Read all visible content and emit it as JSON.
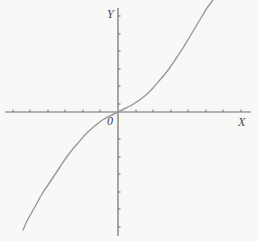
{
  "figure": {
    "background_color": "#f8f8f6",
    "width": 259,
    "height": 241
  },
  "labels": {
    "y_axis": "Y",
    "x_axis": "X",
    "origin": "0"
  },
  "axes": {
    "color": "#6f6f72",
    "x_axis": {
      "y_pixel": 112,
      "x_start_pixel": 5,
      "x_end_pixel": 251,
      "tick_spacing_pixel": 17.6,
      "tick_length_pixel": 3
    },
    "y_axis": {
      "x_pixel": 118,
      "y_start_pixel": 8,
      "y_end_pixel": 236,
      "tick_spacing_pixel": 17.6,
      "tick_length_pixel": 3
    }
  },
  "chart_data": {
    "type": "line",
    "title": "",
    "xlabel": "X",
    "ylabel": "Y",
    "grid": false,
    "legend": "none",
    "curve_color": "#9a9a9c",
    "curve_width": 1.4,
    "function": "y = x^3",
    "xlim": [
      -2.2,
      2.1
    ],
    "ylim": [
      -2.2,
      2.1
    ],
    "x": [
      -2.15,
      -2.0,
      -1.85,
      -1.7,
      -1.55,
      -1.4,
      -1.25,
      -1.1,
      -0.95,
      -0.8,
      -0.65,
      -0.5,
      -0.35,
      -0.2,
      0.0,
      0.2,
      0.35,
      0.5,
      0.65,
      0.8,
      0.95,
      1.1,
      1.25,
      1.4,
      1.55,
      1.7,
      1.85,
      2.0,
      2.1
    ],
    "y": [
      -9.94,
      -8.0,
      -6.33,
      -4.91,
      -3.72,
      -2.74,
      -1.95,
      -1.33,
      -0.86,
      -0.51,
      -0.27,
      -0.13,
      -0.04,
      -0.01,
      0.0,
      0.01,
      0.04,
      0.13,
      0.27,
      0.51,
      0.86,
      1.33,
      1.95,
      2.74,
      3.72,
      4.91,
      6.33,
      8.0,
      9.26
    ],
    "series": [
      {
        "name": "y = x^3",
        "points_pixel": [
          [
            23,
            230
          ],
          [
            27,
            221
          ],
          [
            32,
            212
          ],
          [
            37,
            203
          ],
          [
            42,
            194
          ],
          [
            48,
            185
          ],
          [
            54,
            176
          ],
          [
            60,
            167
          ],
          [
            66,
            158
          ],
          [
            72,
            150
          ],
          [
            78,
            143
          ],
          [
            84,
            136
          ],
          [
            90,
            130
          ],
          [
            96,
            125
          ],
          [
            101,
            121
          ],
          [
            106,
            118
          ],
          [
            110,
            116
          ],
          [
            114,
            114
          ],
          [
            118,
            112
          ],
          [
            122,
            110
          ],
          [
            126,
            108
          ],
          [
            130,
            106
          ],
          [
            135,
            103
          ],
          [
            141,
            99
          ],
          [
            147,
            94
          ],
          [
            153,
            88
          ],
          [
            159,
            81
          ],
          [
            165,
            74
          ],
          [
            171,
            66
          ],
          [
            177,
            57
          ],
          [
            183,
            48
          ],
          [
            189,
            38
          ],
          [
            195,
            28
          ],
          [
            201,
            18
          ],
          [
            207,
            8
          ],
          [
            213,
            0
          ]
        ]
      }
    ]
  }
}
